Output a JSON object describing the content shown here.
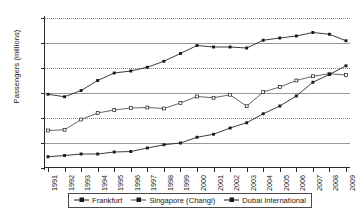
{
  "chart_data": {
    "type": "line",
    "title": "",
    "xlabel": "",
    "ylabel": "Passengers (millions)",
    "ylim": [
      0,
      60
    ],
    "ytick_values": [
      0,
      10,
      20,
      30,
      40,
      50,
      60
    ],
    "ytick_labels": [
      "0",
      "10",
      "20",
      "30",
      "40",
      "50",
      "60"
    ],
    "grid": true,
    "grid_axis": "y",
    "legend_position": "bottom",
    "categories": [
      "1991",
      "1992",
      "1993",
      "1994",
      "1995",
      "1996",
      "1997",
      "1998",
      "1999",
      "2000",
      "2001",
      "2002",
      "2003",
      "2004",
      "2005",
      "2006",
      "2007",
      "2008",
      "2009"
    ],
    "series": [
      {
        "name": "Frankfurt",
        "marker": "filled-square",
        "color": "#1a1a1a",
        "values": [
          29.5,
          28.5,
          31.0,
          35.0,
          38.0,
          38.8,
          40.3,
          42.7,
          45.8,
          49.0,
          48.4,
          48.4,
          48.0,
          51.1,
          52.0,
          52.8,
          54.2,
          53.5,
          50.9
        ]
      },
      {
        "name": "Singapore (Changi)",
        "marker": "open-square",
        "color": "#4a4a4a",
        "values": [
          15.0,
          15.3,
          19.4,
          22.0,
          23.2,
          24.0,
          24.2,
          23.8,
          26.0,
          28.6,
          28.1,
          29.3,
          24.7,
          30.4,
          32.4,
          35.0,
          36.7,
          37.7,
          37.2
        ]
      },
      {
        "name": "Dubai International",
        "marker": "filled-square",
        "color": "#1a1a1a",
        "values": [
          4.5,
          5.0,
          5.6,
          5.6,
          6.4,
          6.6,
          8.0,
          9.3,
          10.0,
          12.3,
          13.5,
          16.0,
          18.1,
          21.7,
          24.8,
          28.8,
          34.3,
          37.4,
          40.9
        ]
      }
    ]
  },
  "legend": {
    "items": [
      {
        "label": "Frankfurt"
      },
      {
        "label": "Singapore (Changi)"
      },
      {
        "label": "Dubai International"
      }
    ]
  }
}
